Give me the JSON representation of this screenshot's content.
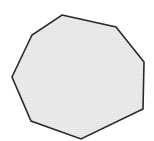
{
  "diagram": {
    "shape": "octagon",
    "vertex_count": 8,
    "vertices": [
      [
        62,
        15
      ],
      [
        116,
        27
      ],
      [
        144,
        62
      ],
      [
        143,
        109
      ],
      [
        81,
        139
      ],
      [
        31,
        121
      ],
      [
        12,
        77
      ],
      [
        32,
        35
      ]
    ],
    "fill_color": "#ebebeb",
    "stroke_color": "#2a2a2a",
    "stroke_width": 1.6,
    "background_color": "#ffffff"
  }
}
